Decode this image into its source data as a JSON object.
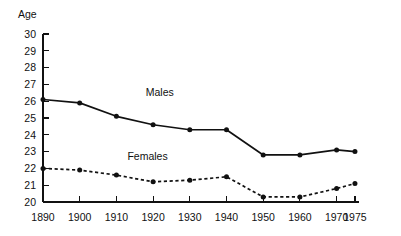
{
  "chart_data": {
    "type": "line",
    "title": "",
    "subtitle": "",
    "xlabel": "",
    "ylabel": "Age",
    "x": [
      1890,
      1900,
      1910,
      1920,
      1930,
      1940,
      1950,
      1960,
      1970,
      1975
    ],
    "xticklabels": [
      "1890",
      "1900",
      "1910",
      "1920",
      "1930",
      "1940",
      "1950",
      "1960",
      "1970",
      "1975"
    ],
    "yticklabels": [
      "20",
      "21",
      "22",
      "23",
      "24",
      "25",
      "26",
      "27",
      "28",
      "29",
      "30"
    ],
    "yticks": [
      20,
      21,
      22,
      23,
      24,
      25,
      26,
      27,
      28,
      29,
      30
    ],
    "ylim": [
      20,
      30
    ],
    "xlim": [
      1890,
      1975
    ],
    "grid": false,
    "legend": "inline-annotations",
    "series": [
      {
        "name": "Males",
        "style": "solid",
        "marker": "filled-circle",
        "color": "#111111",
        "values": [
          26.1,
          25.9,
          25.1,
          24.6,
          24.3,
          24.3,
          22.8,
          22.8,
          23.1,
          23.0
        ]
      },
      {
        "name": "Females",
        "style": "dashed",
        "marker": "filled-circle",
        "color": "#111111",
        "values": [
          22.0,
          21.9,
          21.6,
          21.2,
          21.3,
          21.5,
          20.3,
          20.3,
          20.8,
          21.1
        ]
      }
    ],
    "annotations": [
      {
        "text": "Males",
        "x": 1918,
        "y": 26.3
      },
      {
        "text": "Females",
        "x": 1913,
        "y": 22.5
      }
    ]
  }
}
